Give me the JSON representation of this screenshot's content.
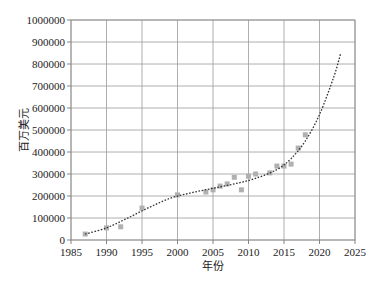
{
  "chart_data": {
    "type": "scatter",
    "title": "",
    "xlabel": "年份",
    "ylabel": "百万美元",
    "xlim": [
      1985,
      2025
    ],
    "ylim": [
      0,
      1000000
    ],
    "x_ticks": [
      1985,
      1990,
      1995,
      2000,
      2005,
      2010,
      2015,
      2020,
      2025
    ],
    "y_ticks": [
      0,
      100000,
      200000,
      300000,
      400000,
      500000,
      600000,
      700000,
      800000,
      900000,
      1000000
    ],
    "grid": true,
    "legend": null,
    "series": [
      {
        "name": "data points",
        "type": "scatter",
        "color": "#b0b0b0",
        "x": [
          1987,
          1990,
          1992,
          1995,
          2000,
          2004,
          2005,
          2006,
          2007,
          2008,
          2009,
          2010,
          2011,
          2013,
          2014,
          2015,
          2016,
          2017,
          2018
        ],
        "values": [
          27000,
          55000,
          60000,
          145000,
          205000,
          218000,
          228000,
          245000,
          255000,
          285000,
          228000,
          290000,
          300000,
          305000,
          336000,
          336000,
          345000,
          418000,
          478000
        ]
      },
      {
        "name": "trend",
        "type": "line",
        "style": "dotted",
        "color": "#333333",
        "x": [
          1987,
          1990,
          1993,
          1996,
          1999,
          2002,
          2005,
          2008,
          2011,
          2014,
          2016,
          2018,
          2020,
          2022,
          2023
        ],
        "values": [
          27000,
          55000,
          100000,
          148000,
          190000,
          215000,
          235000,
          255000,
          280000,
          320000,
          370000,
          450000,
          570000,
          740000,
          850000
        ]
      }
    ]
  }
}
